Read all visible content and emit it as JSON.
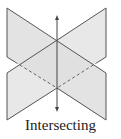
{
  "figure": {
    "caption": "Intersecting",
    "colors": {
      "plane_fill": "#dcdcdc",
      "plane_fill_back": "#e8e8e8",
      "edge": "#555555",
      "dashed_edge": "#666666",
      "axis": "#444444"
    }
  }
}
